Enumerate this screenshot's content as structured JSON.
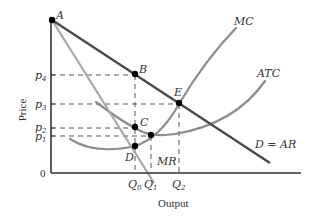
{
  "figure": {
    "axes": {
      "y_title": "Price",
      "x_title": "Output",
      "origin_label": "0"
    },
    "price_ticks": [
      {
        "id": "p4",
        "base": "p",
        "sub": "4"
      },
      {
        "id": "p3",
        "base": "p",
        "sub": "3"
      },
      {
        "id": "p2",
        "base": "p",
        "sub": "2"
      },
      {
        "id": "p1",
        "base": "p",
        "sub": "1"
      }
    ],
    "quantity_ticks": [
      {
        "id": "Q0",
        "base": "Q",
        "sub": "0"
      },
      {
        "id": "Q1",
        "base": "Q",
        "sub": "1"
      },
      {
        "id": "Q2",
        "base": "Q",
        "sub": "2"
      }
    ],
    "curves": {
      "mc": "MC",
      "atc": "ATC",
      "demand": "D = AR",
      "mr": "MR"
    },
    "points": {
      "a": "A",
      "b": "B",
      "c": "C",
      "d": "D",
      "e": "E"
    },
    "colors": {
      "demand": "#4a4a4a",
      "mr": "#a8a8a8",
      "mc": "#8c8c8c",
      "atc": "#8c8c8c",
      "axis": "#333333",
      "dash": "#444444",
      "point": "#000000"
    }
  }
}
